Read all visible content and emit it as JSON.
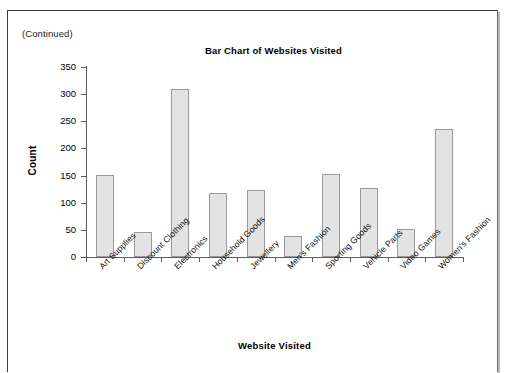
{
  "page": {
    "continued_note": "(Continued)"
  },
  "chart_data": {
    "type": "bar",
    "title": "Bar Chart of Websites Visited",
    "xlabel": "Website Visited",
    "ylabel": "Count",
    "categories": [
      "Art Supplies",
      "Discount Clothing",
      "Electronics",
      "Household Goods",
      "Jewellery",
      "Men's Fashion",
      "Sporting Goods",
      "Vehicle Parts",
      "Video Games",
      "Women's Fashion"
    ],
    "values": [
      151,
      46,
      309,
      118,
      123,
      39,
      153,
      127,
      52,
      236
    ],
    "ylim": [
      0,
      350
    ],
    "ytick_labels": [
      "0",
      "50",
      "100",
      "150",
      "200",
      "250",
      "300",
      "350"
    ],
    "yticks": [
      0,
      50,
      100,
      150,
      200,
      250,
      300,
      350
    ],
    "grid": false,
    "legend": "none",
    "bar_fill_color": "#e3e3e3",
    "bar_border_color": "#9a9a9a",
    "axis_color": "#5b5b5b",
    "background_color": "#ffffff"
  }
}
